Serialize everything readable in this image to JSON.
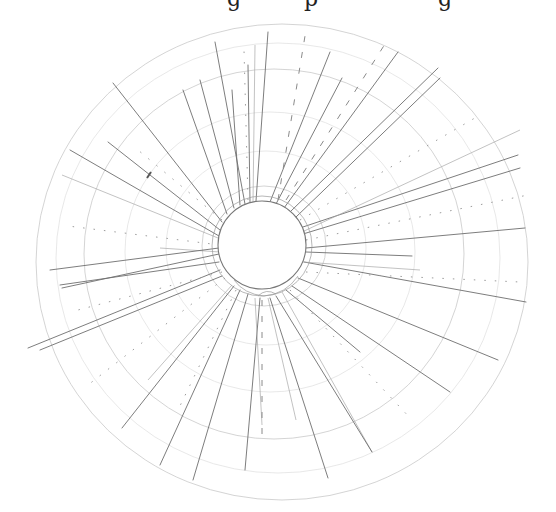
{
  "image": {
    "description": "Pencil sketch of a radial polar grid with a central hub circle and radiating lines",
    "top_clipped_text_fragments": [
      "g",
      "p",
      "g"
    ]
  },
  "geometry": {
    "hub": {
      "cx": 262,
      "cy": 245,
      "r": 44
    },
    "outer_center": {
      "cx": 282,
      "cy": 262
    },
    "ring_radii": [
      60,
      95,
      140,
      185,
      215,
      245
    ],
    "colors": {
      "pencil_dark": "#6e6e6e",
      "pencil_light": "#a8a8a8",
      "ring": "#c9c9c9",
      "background": "#ffffff"
    }
  }
}
